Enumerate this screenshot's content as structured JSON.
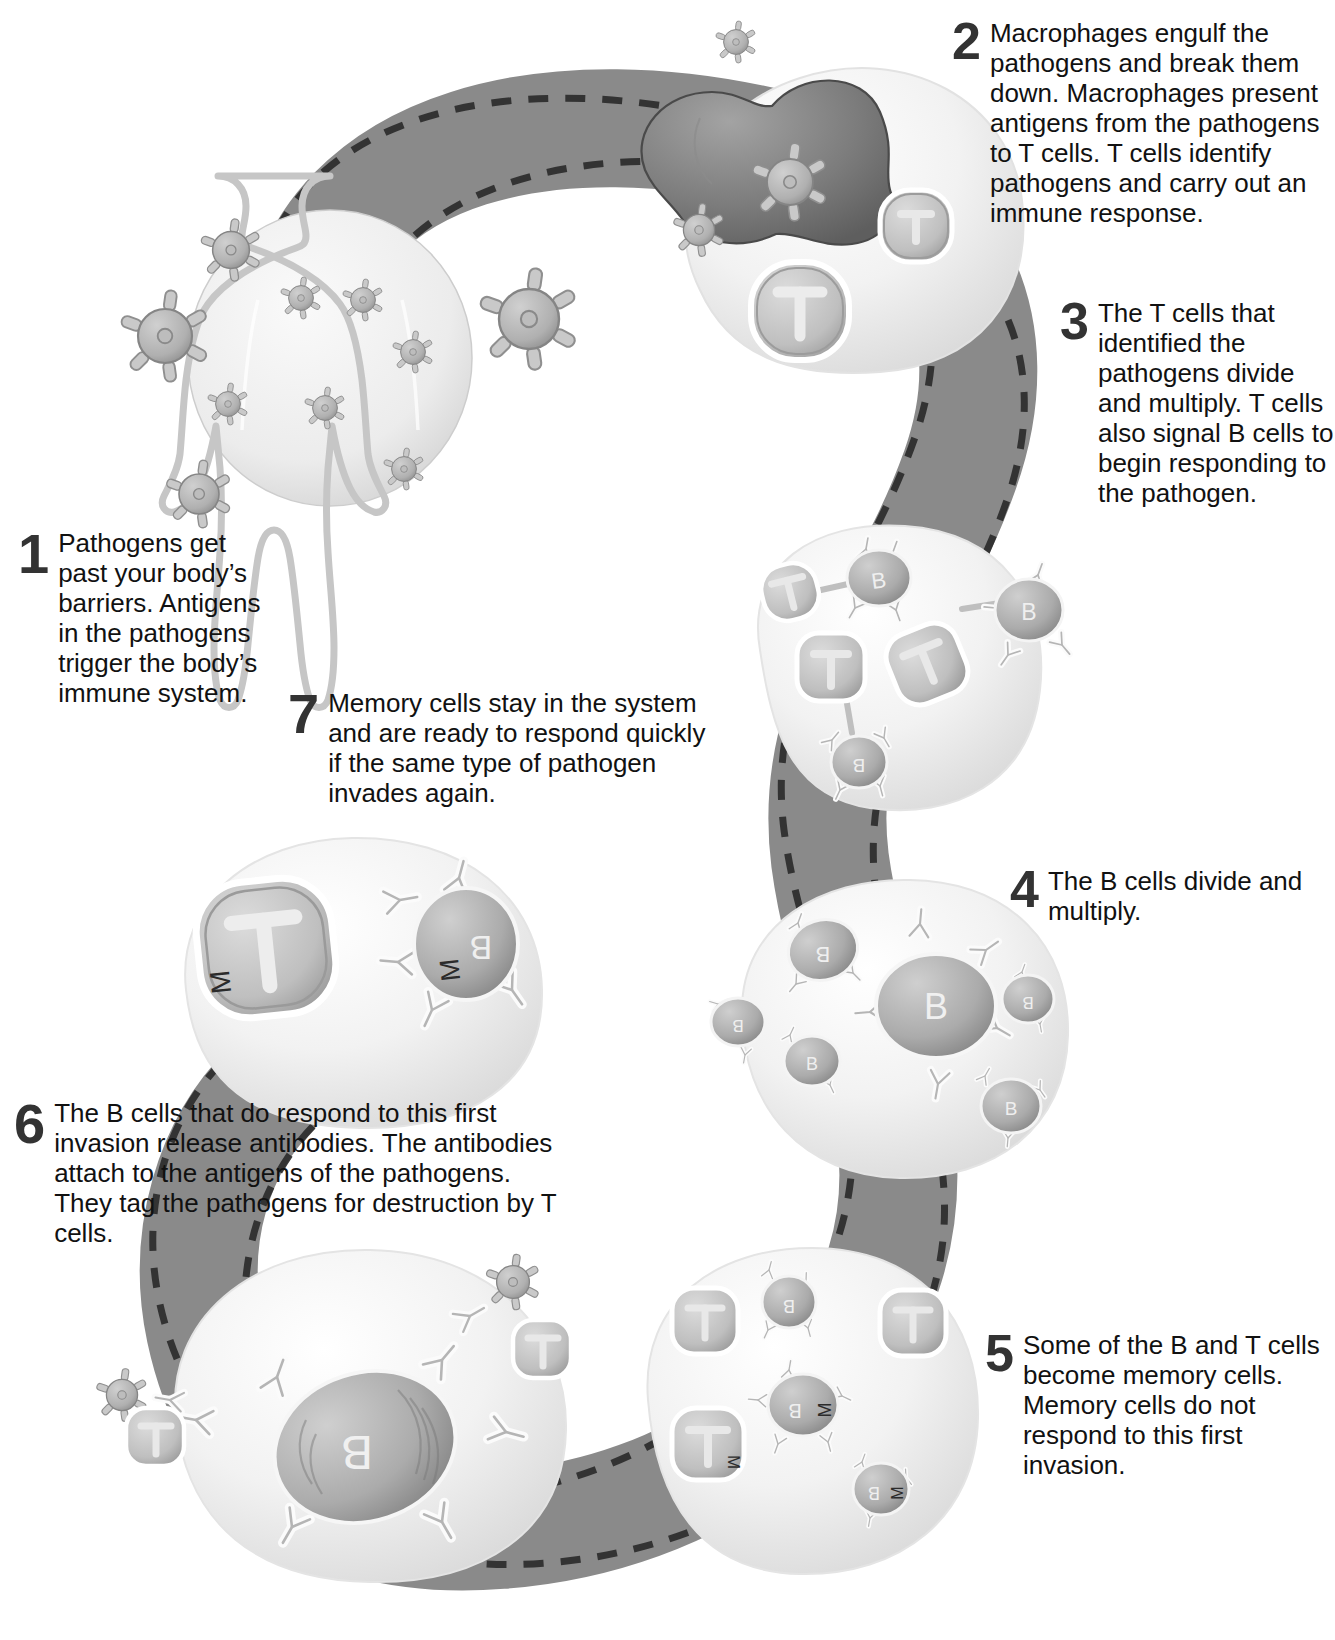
{
  "diagram": {
    "type": "flow-diagram",
    "pathway_color": "#8a8a8a",
    "pathway_border_color": "#2d2d2d",
    "cell_fill_color": "#ededed",
    "background_color": "#ffffff"
  },
  "steps": [
    {
      "number": "1",
      "text": "Pathogens get past your body’s barriers. Antigens in the pathogens trigger the body’s immune system."
    },
    {
      "number": "2",
      "text": "Macrophages engulf the pathogens and break them down. Macrophages present antigens from the pathogens to T cells. T cells identify pathogens and carry out an immune response."
    },
    {
      "number": "3",
      "text": "The T cells that identified the pathogens divide and multiply. T cells also signal B cells to begin responding to the pathogen."
    },
    {
      "number": "4",
      "text": "The B cells divide and multiply."
    },
    {
      "number": "5",
      "text": "Some of the B and T cells become memory cells. Memory cells do not respond to this first invasion."
    },
    {
      "number": "6",
      "text": "The B cells that do respond to this first invasion release antibodies. The antibodies attach to the antigens of the pathogens. They tag the pathogens for destruction by T cells."
    },
    {
      "number": "7",
      "text": "Memory cells stay in the system and are ready to respond quickly if the same type of pathogen invades again."
    }
  ],
  "labels": {
    "t_cell": "T",
    "b_cell": "B",
    "memory": "M"
  }
}
